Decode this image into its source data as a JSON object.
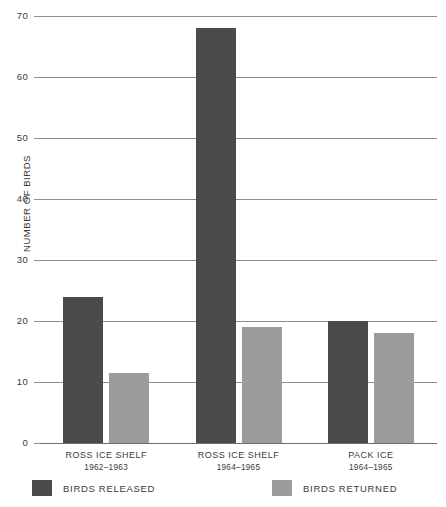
{
  "chart_data": {
    "type": "bar",
    "title": "",
    "xlabel": "",
    "ylabel": "NUMBER OF BIRDS",
    "ylim": [
      0,
      70
    ],
    "yticks": [
      0,
      10,
      20,
      30,
      40,
      50,
      60,
      70
    ],
    "ytick_labels": [
      "0",
      "10",
      "20",
      "30",
      "40",
      "50",
      "60",
      "70"
    ],
    "grid": true,
    "legend_position": "bottom",
    "categories": [
      {
        "name": "ROSS ICE SHELF",
        "years": "1962–1963"
      },
      {
        "name": "ROSS ICE SHELF",
        "years": "1964–1965"
      },
      {
        "name": "PACK ICE",
        "years": "1964–1965"
      }
    ],
    "series": [
      {
        "name": "BIRDS RELEASED",
        "color": "#4b4b4b",
        "values": [
          24,
          68,
          20
        ]
      },
      {
        "name": "BIRDS RETURNED",
        "color": "#9c9c9c",
        "values": [
          11.5,
          19,
          18
        ]
      }
    ]
  },
  "legend": {
    "items": [
      {
        "label": "BIRDS RELEASED",
        "swatch": "released"
      },
      {
        "label": "BIRDS RETURNED",
        "swatch": "returned"
      }
    ]
  },
  "colors": {
    "released": "#4b4b4b",
    "returned": "#9c9c9c",
    "gridline": "#8d8d8d",
    "text": "#3a3a3a",
    "background": "#ffffff"
  }
}
